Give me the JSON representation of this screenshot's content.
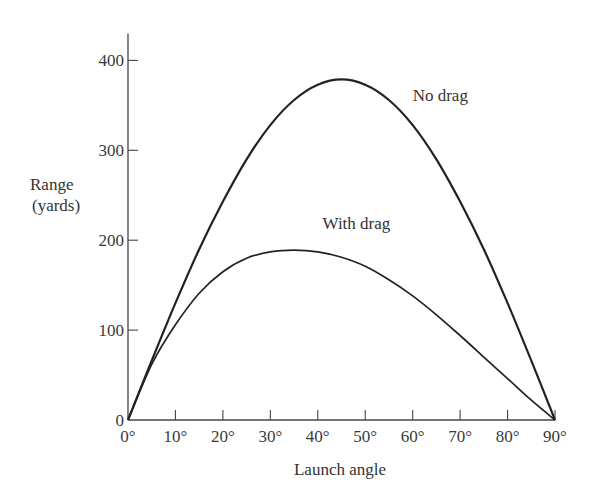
{
  "chart_data": {
    "type": "line",
    "title": "",
    "xlabel": "Launch angle",
    "ylabel_line1": "Range",
    "ylabel_line2": "(yards)",
    "xlim": [
      0,
      90
    ],
    "ylim": [
      0,
      430
    ],
    "grid": false,
    "legend": "inline labels",
    "x_ticks": [
      "0°",
      "10°",
      "20°",
      "30°",
      "40°",
      "50°",
      "60°",
      "70°",
      "80°",
      "90°"
    ],
    "x_tick_values": [
      0,
      10,
      20,
      30,
      40,
      50,
      60,
      70,
      80,
      90
    ],
    "y_ticks": [
      "0",
      "100",
      "200",
      "300",
      "400"
    ],
    "y_tick_values": [
      0,
      100,
      200,
      300,
      400
    ],
    "x": [
      0,
      5,
      10,
      15,
      20,
      25,
      30,
      35,
      40,
      45,
      50,
      55,
      60,
      65,
      70,
      75,
      80,
      85,
      90
    ],
    "series": [
      {
        "name": "No drag",
        "values": [
          0,
          66,
          130,
          190,
          243,
          290,
          328,
          356,
          373,
          379,
          373,
          356,
          328,
          290,
          243,
          190,
          130,
          66,
          0
        ]
      },
      {
        "name": "With drag",
        "values": [
          0,
          62,
          106,
          141,
          165,
          180,
          187,
          189,
          187,
          181,
          171,
          156,
          138,
          117,
          94,
          70,
          46,
          22,
          0
        ]
      }
    ],
    "annotations": [
      {
        "text": "No drag",
        "x": 60,
        "y": 355
      },
      {
        "text": "With drag",
        "x": 41,
        "y": 213
      }
    ]
  }
}
